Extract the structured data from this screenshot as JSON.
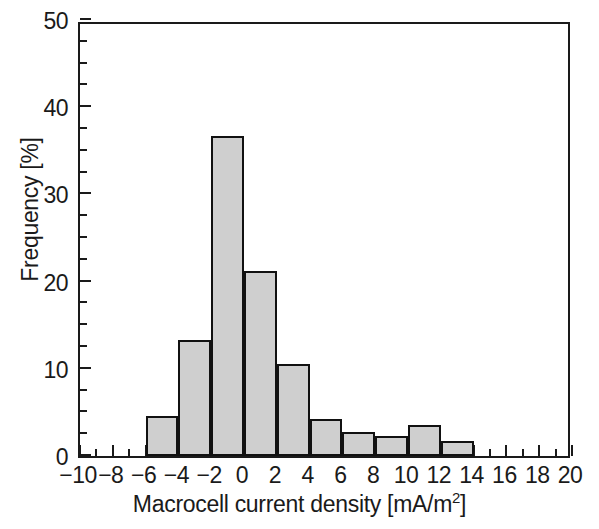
{
  "chart_data": {
    "type": "bar",
    "title": "",
    "subtitle": "",
    "xlabel": "Macrocell current density [mA/m2]",
    "xlabel_base": "Macrocell current density [mA/m",
    "xlabel_sup": "2",
    "xlabel_tail": "]",
    "ylabel": "Frequency [%]",
    "xlim": [
      -10,
      20
    ],
    "ylim": [
      0,
      50
    ],
    "grid": false,
    "legend": null,
    "bin_width": 2,
    "x_major_ticks": [
      -10,
      -8,
      -6,
      -4,
      -2,
      0,
      2,
      4,
      6,
      8,
      10,
      12,
      14,
      16,
      18,
      20
    ],
    "x_tick_labels": [
      "-10",
      "-8",
      "-6",
      "-4",
      "-2",
      "0",
      "2",
      "4",
      "6",
      "8",
      "10",
      "12",
      "14",
      "16",
      "18",
      "20"
    ],
    "x_minor_tick_step": 1,
    "y_major_ticks": [
      0,
      10,
      20,
      30,
      40,
      50
    ],
    "y_tick_labels": [
      "0",
      "10",
      "20",
      "30",
      "40",
      "50"
    ],
    "y_minor_tick_step": 2.5,
    "bar_fill_color": "#cfcfcf",
    "bar_edge_color": "#111111",
    "axis_color": "#1a1a1a",
    "bins": [
      {
        "x_start": -6,
        "x_end": -4,
        "value": 4.6
      },
      {
        "x_start": -4,
        "x_end": -2,
        "value": 13.3
      },
      {
        "x_start": -2,
        "x_end": 0,
        "value": 36.7
      },
      {
        "x_start": 0,
        "x_end": 2,
        "value": 21.2
      },
      {
        "x_start": 2,
        "x_end": 4,
        "value": 10.5
      },
      {
        "x_start": 4,
        "x_end": 6,
        "value": 4.2
      },
      {
        "x_start": 6,
        "x_end": 8,
        "value": 2.8
      },
      {
        "x_start": 8,
        "x_end": 10,
        "value": 2.3
      },
      {
        "x_start": 10,
        "x_end": 12,
        "value": 3.5
      },
      {
        "x_start": 12,
        "x_end": 14,
        "value": 1.7
      }
    ],
    "categories": [
      "-6 to -4",
      "-4 to -2",
      "-2 to 0",
      "0 to 2",
      "2 to 4",
      "4 to 6",
      "6 to 8",
      "8 to 10",
      "10 to 12",
      "12 to 14"
    ],
    "values": [
      4.6,
      13.3,
      36.7,
      21.2,
      10.5,
      4.2,
      2.8,
      2.3,
      3.5,
      1.7
    ]
  },
  "caption": {
    "text": ""
  }
}
